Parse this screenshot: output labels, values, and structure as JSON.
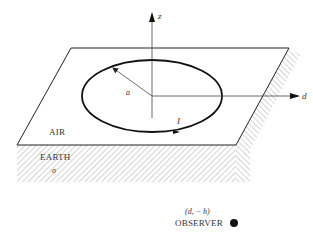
{
  "diagram": {
    "axes": {
      "z_label": "z",
      "d_label": "d"
    },
    "loop": {
      "radius_label": "a",
      "current_label": "I"
    },
    "regions": {
      "air_label": "AIR",
      "earth_label": "EARTH",
      "conductivity_label": "σ"
    },
    "observer": {
      "coordinates_label": "(d, − h)",
      "name_label": "OBSERVER"
    },
    "colors": {
      "line": "#222222",
      "hatch": "#aaaaaa",
      "text": "#333333"
    }
  }
}
